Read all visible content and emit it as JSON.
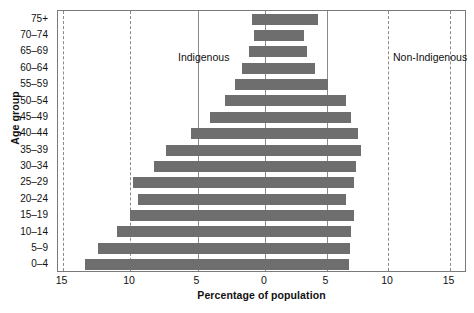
{
  "chart_data": {
    "type": "bar",
    "subtype": "population-pyramid",
    "title": "",
    "xlabel": "Percentage of population",
    "ylabel": "Age group",
    "categories": [
      "0–4",
      "5–9",
      "10–14",
      "15–19",
      "20–24",
      "25–29",
      "30–34",
      "35–39",
      "40–44",
      "45–49",
      "50–54",
      "55–59",
      "60–64",
      "65–69",
      "70–74",
      "75+"
    ],
    "series": [
      {
        "name": "Indigenous",
        "side": "left",
        "values": [
          13.3,
          12.4,
          11.0,
          10.0,
          9.4,
          9.8,
          8.2,
          7.3,
          5.5,
          4.1,
          3.0,
          2.2,
          1.7,
          1.2,
          0.8,
          1.0
        ]
      },
      {
        "name": "Non-Indigenous",
        "side": "right",
        "values": [
          6.8,
          6.9,
          7.0,
          7.2,
          6.6,
          7.2,
          7.4,
          7.8,
          7.6,
          7.0,
          6.6,
          5.1,
          4.1,
          3.4,
          3.2,
          4.3
        ]
      }
    ],
    "xlim": [
      -15,
      15
    ],
    "x_tick_values": [
      15,
      10,
      5,
      0,
      5,
      10,
      15
    ],
    "x_tick_labels": [
      "15",
      "10",
      "5",
      "0",
      "5",
      "10",
      "15"
    ],
    "gridlines": {
      "vertical": true,
      "style": "dashed",
      "center_solid": true
    },
    "legend_position": "in-plot",
    "bar_color": "#6e6e6e",
    "grid_color": "#8a8a8a",
    "axis_color": "#7a7a7a",
    "background": "#ffffff"
  },
  "axes": {
    "y_title": "Age group",
    "x_title": "Percentage of population"
  },
  "annotations": {
    "left_label": "Indigenous",
    "right_label": "Non-Indigenous"
  }
}
